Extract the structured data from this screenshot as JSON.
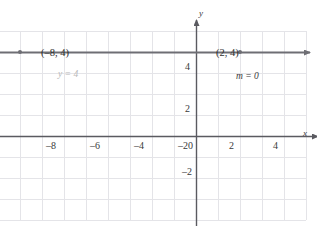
{
  "chart_data": {
    "type": "line",
    "title": "",
    "xlabel": "x",
    "ylabel": "y",
    "xlim": [
      -10,
      5
    ],
    "ylim": [
      -4,
      5
    ],
    "grid": true,
    "legend": "none",
    "x_ticks": [
      -8,
      -6,
      -4,
      -2,
      0,
      2,
      4
    ],
    "x_tick_labels": [
      "–8",
      "–6",
      "–4",
      "–2",
      "0",
      "2",
      "4"
    ],
    "y_ticks": [
      4,
      2,
      -2
    ],
    "y_tick_labels": [
      "4",
      "2",
      "–2"
    ],
    "origin_label": "0",
    "series": [
      {
        "name": "y = 4",
        "equation": "y = 4",
        "slope": 0,
        "slope_label": "m = 0",
        "type": "horizontal-line",
        "y_value": 4,
        "x_start": -10,
        "x_end": 5,
        "arrow_start": true,
        "arrow_end": true,
        "points": [
          {
            "x": -8,
            "y": 4,
            "label": "(–8, 4)"
          },
          {
            "x": 2,
            "y": 4,
            "label": "(2, 4)"
          }
        ]
      }
    ],
    "annotations": [
      {
        "text": "y = 4",
        "x": -7.2,
        "y": 3.5,
        "style": "faint"
      },
      {
        "text": "m = 0",
        "x": 2.1,
        "y": 3.4,
        "style": "dark"
      }
    ]
  },
  "axes": {
    "x_axis_name": "x",
    "y_axis_name": "y"
  },
  "colors": {
    "grid": "#e2e2e6",
    "axis": "#5a5a60",
    "line": "#6e6e74",
    "tick_text": "#3a3a3a",
    "faint_text": "#b9b9b9",
    "background": "#ffffff"
  }
}
